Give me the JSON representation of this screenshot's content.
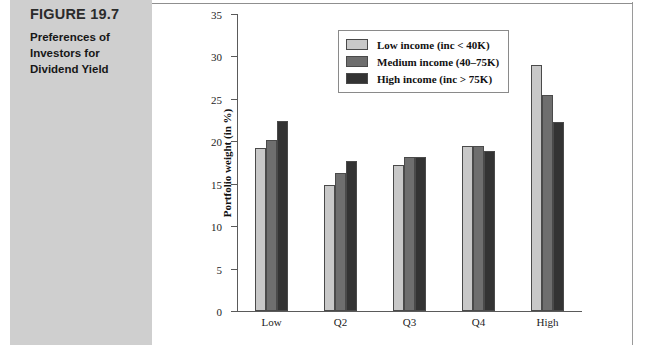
{
  "figure": {
    "label": "FIGURE 19.7",
    "caption": "Preferences of Investors for Dividend Yield"
  },
  "legend": {
    "items": [
      {
        "label": "Low income (inc < 40K)",
        "color": "#c8c8c8"
      },
      {
        "label": "Medium income (40–75K)",
        "color": "#6e6e6e"
      },
      {
        "label": "High income (inc > 75K)",
        "color": "#333333"
      }
    ]
  },
  "chart_data": {
    "type": "bar",
    "title": "Preferences of Investors for Dividend Yield",
    "xlabel": "",
    "ylabel": "Portfolio weight (in %)",
    "categories": [
      "Low",
      "Q2",
      "Q3",
      "Q4",
      "High"
    ],
    "series": [
      {
        "name": "Low income (inc < 40K)",
        "color": "#c8c8c8",
        "values": [
          19.2,
          14.9,
          17.2,
          19.4,
          29.0
        ]
      },
      {
        "name": "Medium income (40–75K)",
        "color": "#6e6e6e",
        "values": [
          20.1,
          16.3,
          18.2,
          19.5,
          25.4
        ]
      },
      {
        "name": "High income (inc > 75K)",
        "color": "#333333",
        "values": [
          22.4,
          17.7,
          18.1,
          18.9,
          22.3
        ]
      }
    ],
    "ylim": [
      0,
      35
    ],
    "ytick_step": 5,
    "yticks": [
      0,
      5,
      10,
      15,
      20,
      25,
      30,
      35
    ],
    "grid": false,
    "legend_position": "top-left-inside"
  }
}
